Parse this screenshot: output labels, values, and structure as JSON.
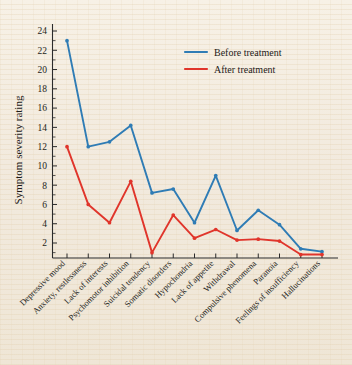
{
  "chart_data": {
    "type": "line",
    "title": "",
    "xlabel": "",
    "ylabel": "Symptom severity rating",
    "ylim": [
      0.35,
      24.8
    ],
    "yticks": [
      2,
      4,
      6,
      8,
      10,
      12,
      14,
      16,
      18,
      20,
      22,
      24
    ],
    "grid": false,
    "legend_position": "top-right",
    "categories": [
      "Depressive mood",
      "Anxiety, restlessness",
      "Lack of interests",
      "Psychomotor inhibition",
      "Suicidal tendency",
      "Somatic disorders",
      "Hypochondria",
      "Lack of appetite",
      "Withdrawal",
      "Compulsive phenomena",
      "Paranoia",
      "Feelings of insufficiency",
      "Hallucinations"
    ],
    "series": [
      {
        "name": "Before treatment",
        "color": "#2f7cb5",
        "values": [
          23,
          12,
          12.5,
          14.2,
          7.2,
          7.6,
          4.1,
          9,
          3.3,
          5.4,
          3.9,
          1.4,
          1.1
        ]
      },
      {
        "name": "After treatment",
        "color": "#e0352b",
        "values": [
          12,
          6,
          4.1,
          8.4,
          1,
          4.9,
          2.5,
          3.4,
          2.3,
          2.4,
          2.2,
          0.8,
          0.8
        ]
      }
    ]
  },
  "colors": {
    "before": "#2f7cb5",
    "after": "#e0352b",
    "axis": "#2b2b2b",
    "paper": "#f2eade"
  }
}
